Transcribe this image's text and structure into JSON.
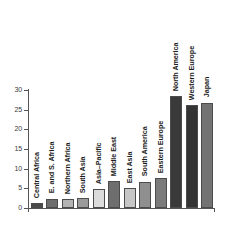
{
  "chart_data": {
    "type": "bar",
    "title": "",
    "subtitle": "",
    "xlabel": "",
    "ylabel": "",
    "ylim": [
      0,
      30
    ],
    "yticks": [
      "0",
      "5",
      "10",
      "15",
      "20",
      "25",
      "30"
    ],
    "ytick_values": [
      0,
      5,
      10,
      15,
      20,
      25,
      30
    ],
    "grid": false,
    "legend": false,
    "legend_position": "none",
    "orientation": "vertical",
    "label_rotation": 90,
    "categories": [
      "Central Africa",
      "E. and S. Africa",
      "Northern Africa",
      "South Asia",
      "Asia–Pacific",
      "Middle East",
      "East Asia",
      "South America",
      "Eastern Europe",
      "North America",
      "Western Europe",
      "Japan"
    ],
    "values": [
      1.2,
      2.4,
      2.3,
      2.6,
      4.8,
      6.8,
      5.1,
      6.7,
      7.6,
      28.5,
      26.2,
      26.8
    ],
    "bar_colors": [
      "#4a4a4a",
      "#6e6e6e",
      "#b4b4b4",
      "#9a9a9a",
      "#dcdcdc",
      "#6e6e6e",
      "#c6c6c6",
      "#8f8f8f",
      "#7b7b7b",
      "#3a3a3a",
      "#343434",
      "#737373"
    ],
    "bar_edge_color": "#4c4c4c",
    "axis_color": "#555555",
    "text_color": "#1c1c1c",
    "background_color": "#ffffff"
  }
}
